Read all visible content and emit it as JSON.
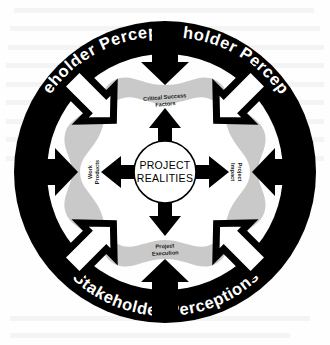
{
  "diagram": {
    "colors": {
      "ring_fill": "#000000",
      "ring_text": "#ffffff",
      "page_background": "#fefefe",
      "outer_blob_fill": "#c9c9c9",
      "inner_blob_fill": "#ffffff",
      "arrow_solid": "#000000",
      "arrow_outline_fill": "#ffffff",
      "arrow_outline_stroke": "#000000",
      "center_circle_fill": "#ffffff",
      "center_circle_stroke": "#000000",
      "label_text": "#1a1a1a"
    },
    "ring": {
      "name": "stakeholder-perceptions-ring",
      "label": "Stakeholder Perceptions",
      "repeat_count": 3,
      "arcs": [
        {
          "id": "arc-top-left",
          "label": "Stakeholder Perceptions"
        },
        {
          "id": "arc-top-right",
          "label": "Stakeholder Perceptions"
        },
        {
          "id": "arc-bottom",
          "label": "Stakeholder Perceptions"
        }
      ]
    },
    "center": {
      "name": "project-realities-core",
      "line1": "PROJECT",
      "line2": "REALITIES"
    },
    "quadrants": [
      {
        "id": "critical-success-factors",
        "position": "top",
        "line1": "Critical Success",
        "line2": "Factors",
        "rotation": 0
      },
      {
        "id": "project-impact",
        "position": "right",
        "line1": "Project",
        "line2": "Impact",
        "rotation": 90
      },
      {
        "id": "project-execution",
        "position": "bottom",
        "line1": "Project",
        "line2": "Execution",
        "rotation": 0
      },
      {
        "id": "work-products",
        "position": "left",
        "line1": "Work",
        "line2": "Products",
        "rotation": -90
      }
    ],
    "inward_arrows": {
      "name": "stakeholder-inward-arrows",
      "count": 8,
      "description": "arrows pointing inward from the ring toward the core",
      "cardinal_style": "solid-black",
      "diagonal_style": "white-fill-black-outline"
    },
    "outward_arrows": {
      "name": "project-realities-outward-arrows",
      "count": 4,
      "description": "solid black arrows radiating from the center circle",
      "style": "solid-black"
    }
  }
}
